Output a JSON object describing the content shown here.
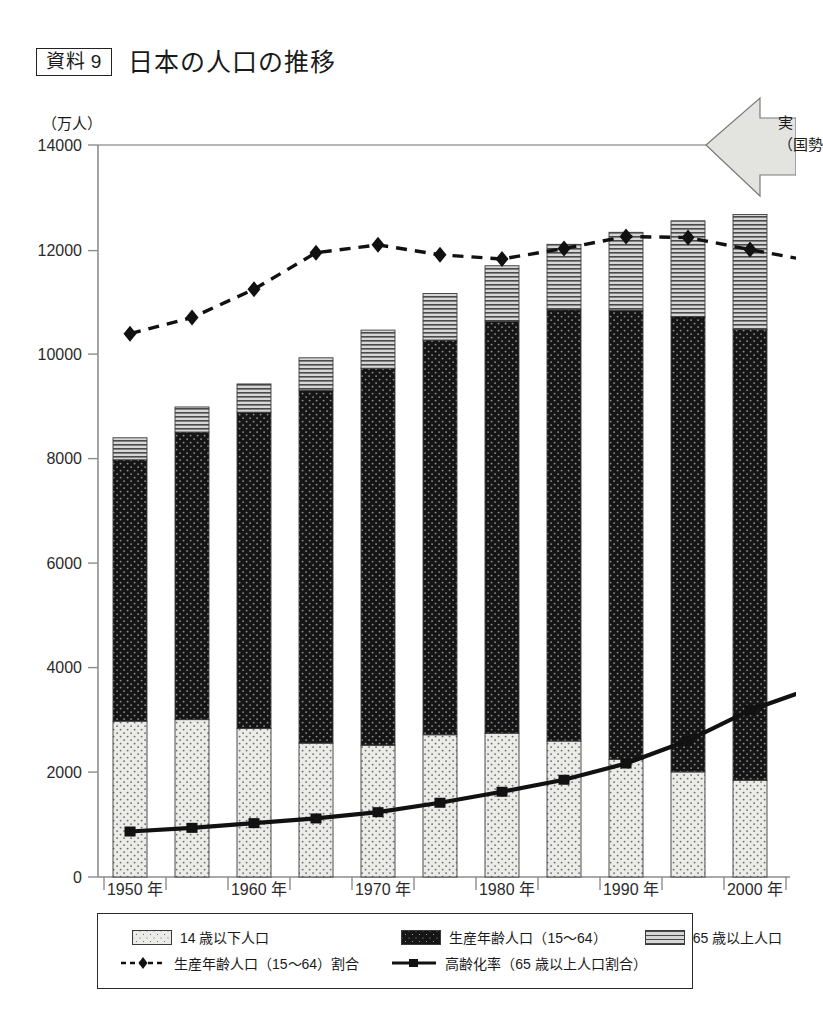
{
  "title": {
    "badge": "資料 9",
    "heading": "日本の人口の推移"
  },
  "axis": {
    "y_unit": "（万人）",
    "y_ticks": [
      "14000",
      "12000",
      "10000",
      "8000",
      "6000",
      "4000",
      "2000",
      "0"
    ],
    "y_min": 0,
    "y_max": 14000,
    "x_labels": [
      "1950 年",
      "1960 年",
      "1970 年",
      "1980 年",
      "1990 年",
      "2000 年"
    ]
  },
  "annotation": {
    "arrow_line1": "実",
    "arrow_line2": "（国勢"
  },
  "legend": {
    "young": "14 歳以下人口",
    "working": "生産年齢人口（15〜64）",
    "old": "65 歳以上人口",
    "working_ratio": "生産年齢人口（15〜64）割合",
    "aging_rate": "高齢化率（65 歳以上人口割合）"
  },
  "colors": {
    "young_fill": "#ebebe8",
    "working_fill": "#151515",
    "old_fill": "#c9c9c9",
    "line_dark": "#111111",
    "axis": "#8a8a8a",
    "arrow_fill": "#e3e3e0"
  },
  "chart_data": {
    "type": "bar",
    "subtype": "stacked-bar-with-lines",
    "title": "日本の人口の推移",
    "xlabel": "",
    "ylabel": "（万人）",
    "ylim": [
      0,
      14000
    ],
    "grid": false,
    "legend_position": "bottom",
    "categories": [
      "1950",
      "1955",
      "1960",
      "1965",
      "1970",
      "1975",
      "1980",
      "1985",
      "1990",
      "1995",
      "2000"
    ],
    "tick_labels": [
      "1950 年",
      "1960 年",
      "1970 年",
      "1980 年",
      "1990 年",
      "2000 年"
    ],
    "series": [
      {
        "name": "14 歳以下人口",
        "type": "bar-segment",
        "values": [
          2980,
          3010,
          2840,
          2560,
          2520,
          2720,
          2750,
          2600,
          2250,
          2010,
          1850
        ]
      },
      {
        "name": "生産年齢人口（15〜64）",
        "type": "bar-segment",
        "values": [
          5000,
          5500,
          6050,
          6750,
          7210,
          7550,
          7880,
          8250,
          8590,
          8710,
          8620
        ]
      },
      {
        "name": "65 歳以上人口",
        "type": "bar-segment",
        "values": [
          420,
          480,
          540,
          620,
          730,
          890,
          1060,
          1250,
          1490,
          1830,
          2200
        ]
      },
      {
        "name": "総人口",
        "type": "bar-total",
        "values": [
          8400,
          8990,
          9430,
          9930,
          10460,
          11160,
          11690,
          12100,
          12330,
          12550,
          12670
        ]
      },
      {
        "name": "生産年齢人口（15〜64）割合",
        "type": "line-dashed-diamond",
        "plotted_values": [
          10390,
          10700,
          11240,
          11940,
          12090,
          11900,
          11820,
          12020,
          12250,
          12230,
          12000
        ]
      },
      {
        "name": "高齢化率（65 歳以上人口割合）",
        "type": "line-solid-square",
        "plotted_values": [
          870,
          940,
          1030,
          1120,
          1240,
          1420,
          1630,
          1860,
          2170,
          2610,
          3190
        ]
      }
    ]
  }
}
